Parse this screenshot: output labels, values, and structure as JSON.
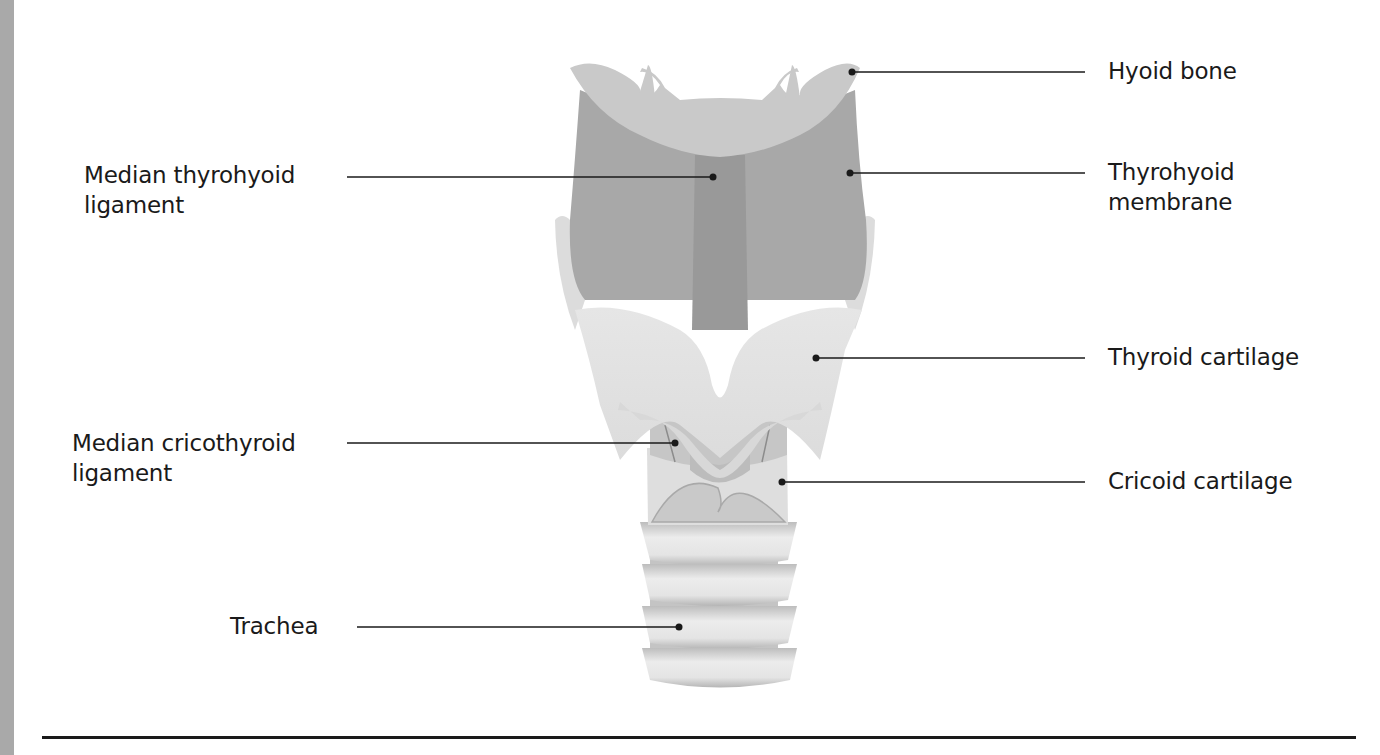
{
  "figure": {
    "labels": {
      "hyoid_bone": {
        "line1": "Hyoid bone"
      },
      "thyrohyoid_membrane": {
        "line1": "Thyrohyoid",
        "line2": "membrane"
      },
      "median_thyrohyoid_ligament": {
        "line1": "Median thyrohyoid",
        "line2": "ligament"
      },
      "thyroid_cartilage": {
        "line1": "Thyroid cartilage"
      },
      "median_cricothyroid_ligament": {
        "line1": "Median cricothyroid",
        "line2": "ligament"
      },
      "cricoid_cartilage": {
        "line1": "Cricoid cartilage"
      },
      "trachea": {
        "line1": "Trachea"
      }
    },
    "colors": {
      "side_strip": "#a9a9a9",
      "membrane": "#a8a8a8",
      "ligament": "#9a9a9a",
      "hyoid": "#c8c8c8",
      "thyroid": "#e2e2e2",
      "cricoid": "#dedede",
      "trachea_ring": "#d6d6d6",
      "leader": "#1a1a1a"
    }
  }
}
